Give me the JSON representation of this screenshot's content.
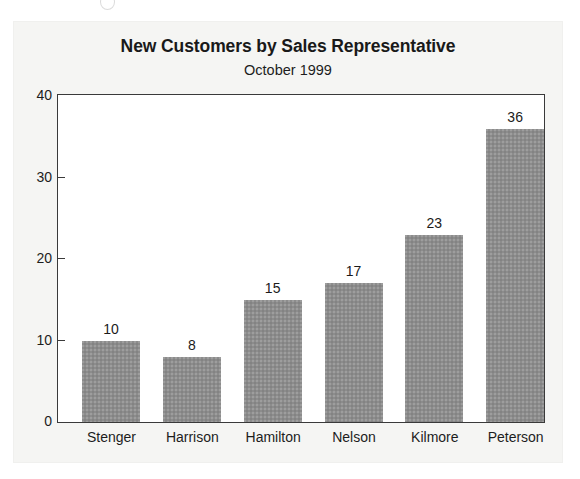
{
  "figure": {
    "title": "New Customers by Sales Representative",
    "subtitle": "October 1999"
  },
  "colors": {
    "bar_fill": "#8c8c8c",
    "frame": "#3a3a3a",
    "plot_background": "#ffffff",
    "panel_background": "#f5f5f3",
    "text": "#1d1d1d"
  },
  "chart_data": {
    "type": "bar",
    "title": "New Customers by Sales Representative",
    "subtitle": "October 1999",
    "categories": [
      "Stenger",
      "Harrison",
      "Hamilton",
      "Nelson",
      "Kilmore",
      "Peterson"
    ],
    "values": [
      10,
      8,
      15,
      17,
      23,
      36
    ],
    "value_labels": [
      "10",
      "8",
      "15",
      "17",
      "23",
      "36"
    ],
    "xlabel": "",
    "ylabel": "",
    "ylim": [
      0,
      40
    ],
    "yticks": [
      0,
      10,
      20,
      30,
      40
    ],
    "ytick_labels": [
      "0",
      "10",
      "20",
      "30",
      "40"
    ],
    "grid": false,
    "legend": false,
    "series": [
      {
        "name": "New Customers",
        "values": [
          10,
          8,
          15,
          17,
          23,
          36
        ]
      }
    ]
  }
}
